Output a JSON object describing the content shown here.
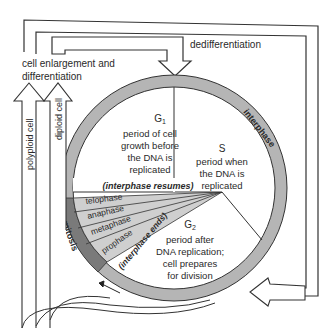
{
  "diagram": {
    "labels": {
      "dedifferentiation": "dedifferentiation",
      "cell_enlargement_1": "cell enlargement and",
      "cell_enlargement_2": "differentiation",
      "polyploid_cell": "polyploid cell",
      "diploid_cell": "diploid cell",
      "interphase": "interphase",
      "mitosis": "mitosis",
      "interphase_resumes": "(interphase resumes)",
      "interphase_ends": "(interphase ends)"
    },
    "phases": {
      "g1": {
        "name": "G",
        "sub": "1",
        "lines": [
          "period of cell",
          "growth before",
          "the DNA is",
          "replicated"
        ]
      },
      "s": {
        "name": "S",
        "lines": [
          "period when",
          "the DNA is",
          "replicated"
        ]
      },
      "g2": {
        "name": "G",
        "sub": "2",
        "lines": [
          "period after",
          "DNA replication;",
          "cell prepares",
          "for division"
        ]
      }
    },
    "mitosis_stages": [
      "telophase",
      "anaphase",
      "metaphase",
      "prophase"
    ],
    "colors": {
      "ring": "#b5b5b5",
      "mitosis_ring": "#7a7a7a",
      "mitosis_sector": "#cfcfcf",
      "stroke": "#333333"
    }
  }
}
